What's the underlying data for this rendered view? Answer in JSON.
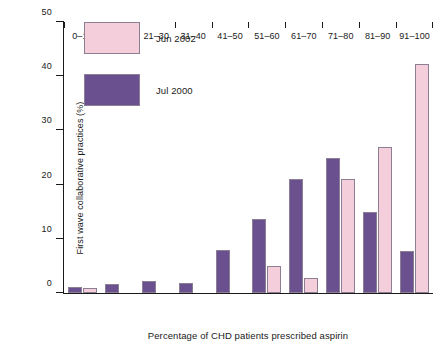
{
  "chart_data": {
    "type": "bar",
    "title": "",
    "xlabel": "Percentage of CHD patients prescribed aspirin",
    "ylabel": "First wave collaborative practices (%)",
    "categories": [
      "0–10",
      "11–20",
      "21–30",
      "31–40",
      "41–50",
      "51–60",
      "61–70",
      "71–80",
      "81–90",
      "91–100"
    ],
    "series": [
      {
        "name": "Jul 2000",
        "color": "#6B5090",
        "values": [
          1.2,
          1.7,
          2.2,
          1.8,
          8.0,
          13.7,
          21.0,
          25.0,
          15.0,
          7.8
        ]
      },
      {
        "name": "Jun 2002",
        "color": "#F5CEDC",
        "values": [
          1.0,
          0,
          0,
          0,
          0,
          5.0,
          2.8,
          21.0,
          27.0,
          42.3
        ]
      }
    ],
    "ylim": [
      0,
      50
    ],
    "yticks": [
      0,
      10,
      20,
      30,
      40,
      50
    ],
    "ytick_labels": [
      "0",
      "10",
      "20",
      "30",
      "40",
      "50"
    ],
    "grid": false,
    "legend_position": "top-left",
    "bar_border_color": "#8d7f93"
  },
  "legend": {
    "entries": [
      {
        "label": "Jun 2002",
        "color": "#F5CEDC"
      },
      {
        "label": "Jul 2000",
        "color": "#6B5090"
      }
    ]
  }
}
